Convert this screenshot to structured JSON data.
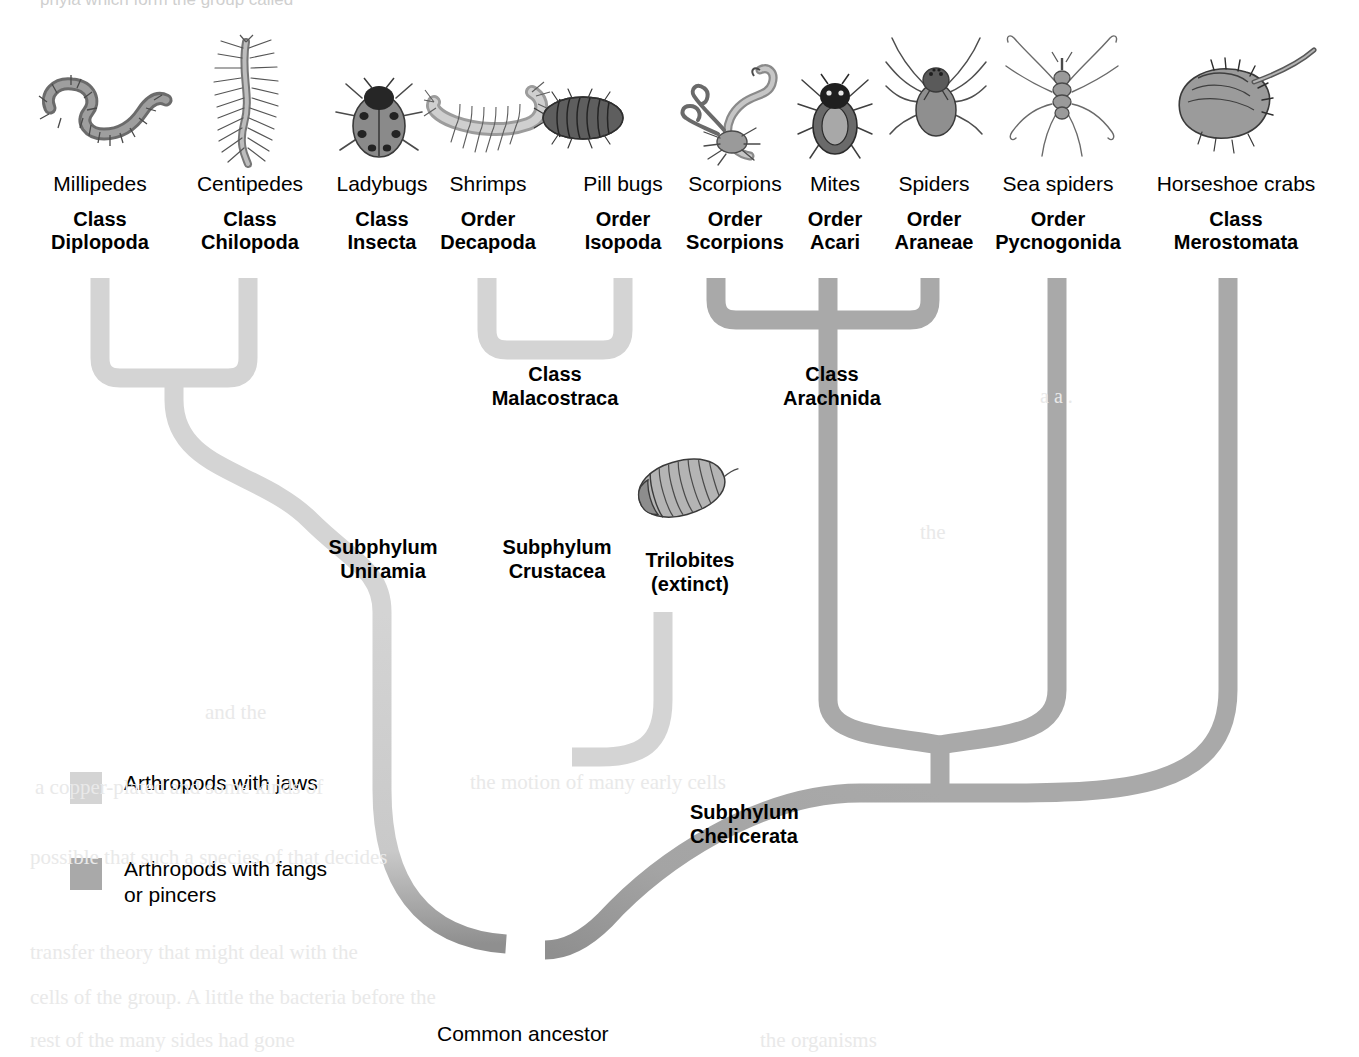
{
  "page_fragment_top": "phyla which form the group called",
  "colors": {
    "jaws": "#d4d4d4",
    "fangs": "#a9a9a9",
    "root_dark": "#8f8f8f",
    "text": "#000000"
  },
  "taxa": [
    {
      "common": "Millipedes",
      "rank": "Class",
      "name": "Diplopoda",
      "icon": "millipede-illustration"
    },
    {
      "common": "Centipedes",
      "rank": "Class",
      "name": "Chilopoda",
      "icon": "centipede-illustration"
    },
    {
      "common": "Ladybugs",
      "rank": "Class",
      "name": "Insecta",
      "icon": "ladybug-illustration"
    },
    {
      "common": "Shrimps",
      "rank": "Order",
      "name": "Decapoda",
      "icon": "shrimp-illustration"
    },
    {
      "common": "Pill bugs",
      "rank": "Order",
      "name": "Isopoda",
      "icon": "pillbug-illustration"
    },
    {
      "common": "Scorpions",
      "rank": "Order",
      "name": "Scorpions",
      "icon": "scorpion-illustration"
    },
    {
      "common": "Mites",
      "rank": "Order",
      "name": "Acari",
      "icon": "mite-illustration"
    },
    {
      "common": "Spiders",
      "rank": "Order",
      "name": "Araneae",
      "icon": "spider-illustration"
    },
    {
      "common": "Sea spiders",
      "rank": "Order",
      "name": "Pycnogonida",
      "icon": "sea-spider-illustration"
    },
    {
      "common": "Horseshoe crabs",
      "rank": "Class",
      "name": "Merostomata",
      "icon": "horseshoe-crab-illustration"
    }
  ],
  "clades": [
    {
      "id": "malacostraca",
      "rank": "Class",
      "name": "Malacostraca"
    },
    {
      "id": "arachnida",
      "rank": "Class",
      "name": "Arachnida"
    },
    {
      "id": "uniramia",
      "rank": "Subphylum",
      "name": "Uniramia"
    },
    {
      "id": "crustacea",
      "rank": "Subphylum",
      "name": "Crustacea"
    },
    {
      "id": "chelicerata",
      "rank": "Subphylum",
      "name": "Chelicerata"
    }
  ],
  "trilobites": {
    "line1": "Trilobites",
    "line2": "(extinct)"
  },
  "root": {
    "label": "Common ancestor"
  },
  "legend": {
    "items": [
      {
        "id": "jaws",
        "line1": "Arthropods with jaws",
        "line2": "",
        "color": "#d4d4d4"
      },
      {
        "id": "fangs",
        "line1": "Arthropods with fangs",
        "line2": "or pincers",
        "color": "#a9a9a9"
      }
    ]
  },
  "ghost_text": [
    {
      "t": "a a .",
      "x": 1040,
      "y": 385,
      "s": 20
    },
    {
      "t": "the",
      "x": 920,
      "y": 520,
      "s": 21
    },
    {
      "t": "and the",
      "x": 205,
      "y": 700,
      "s": 21
    },
    {
      "t": "a  copper-plated  and  some  kinds of",
      "x": 35,
      "y": 775,
      "s": 21
    },
    {
      "t": "the  motion  of  many  early  cells",
      "x": 470,
      "y": 770,
      "s": 21
    },
    {
      "t": "possible  that  such  a  species  of  that  decides",
      "x": 30,
      "y": 845,
      "s": 21
    },
    {
      "t": "transfer  theory  that  might  deal  with  the",
      "x": 30,
      "y": 940,
      "s": 21
    },
    {
      "t": "cells  of  the  group.  A  little  the  bacteria  before  the",
      "x": 30,
      "y": 985,
      "s": 21
    },
    {
      "t": "rest  of  the  many  sides  had  gone",
      "x": 30,
      "y": 1028,
      "s": 21
    },
    {
      "t": "the  organisms",
      "x": 760,
      "y": 1028,
      "s": 21
    }
  ]
}
